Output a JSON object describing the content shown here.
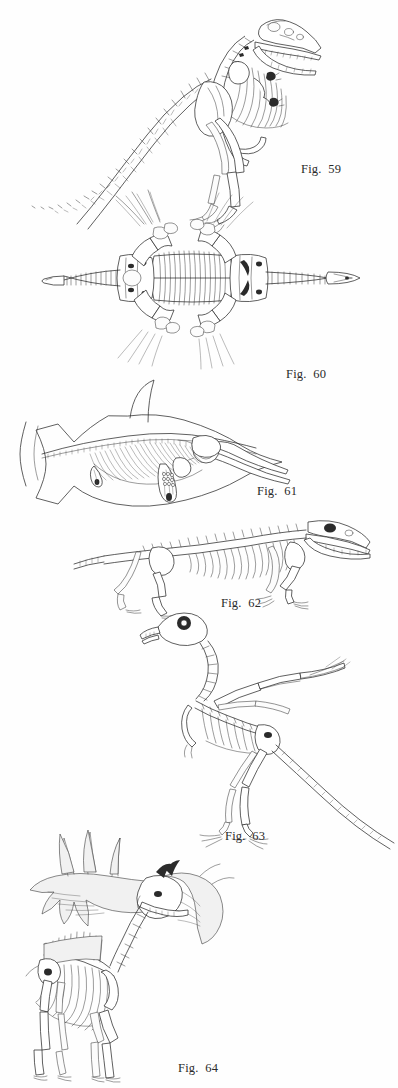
{
  "page": {
    "kind": "book-plate",
    "background_color": "#fefefe",
    "ink_color": "#2b2b2b",
    "width_px": 398,
    "height_px": 1088
  },
  "figures": [
    {
      "id": "fig-59",
      "caption": "Fig.  59",
      "number": "59",
      "subject": "tyrannosaurus-skeleton",
      "view": "lateral",
      "caption_x": 301,
      "caption_y": 163,
      "art_x": 8,
      "art_y": 6,
      "art_w": 330,
      "art_h": 205
    },
    {
      "id": "fig-60",
      "caption": "Fig.  60",
      "number": "60",
      "subject": "plesiosaur-skeleton",
      "view": "dorsal",
      "caption_x": 286,
      "caption_y": 368,
      "art_x": 22,
      "art_y": 224,
      "art_w": 360,
      "art_h": 165
    },
    {
      "id": "fig-61",
      "caption": "Fig.  61",
      "number": "61",
      "subject": "ichthyosaur-skeleton",
      "view": "lateral",
      "caption_x": 257,
      "caption_y": 487,
      "art_x": 18,
      "art_y": 404,
      "art_w": 300,
      "art_h": 95
    },
    {
      "id": "fig-62",
      "caption": "Fig.  62",
      "number": "62",
      "subject": "mammal-like-reptile-skeleton",
      "view": "lateral",
      "caption_x": 221,
      "caption_y": 597,
      "art_x": 70,
      "art_y": 518,
      "art_w": 300,
      "art_h": 80
    },
    {
      "id": "fig-63",
      "caption": "Fig.  63",
      "number": "63",
      "subject": "archaeopteryx-skeleton",
      "view": "lateral",
      "caption_x": 225,
      "caption_y": 830,
      "art_x": 140,
      "art_y": 607,
      "art_w": 258,
      "art_h": 220
    },
    {
      "id": "fig-64",
      "caption": "Fig.  64",
      "number": "64",
      "subject": "irish-elk-skeleton",
      "view": "lateral",
      "caption_x": 178,
      "caption_y": 1064,
      "art_x": 14,
      "art_y": 820,
      "art_w": 250,
      "art_h": 252
    }
  ]
}
